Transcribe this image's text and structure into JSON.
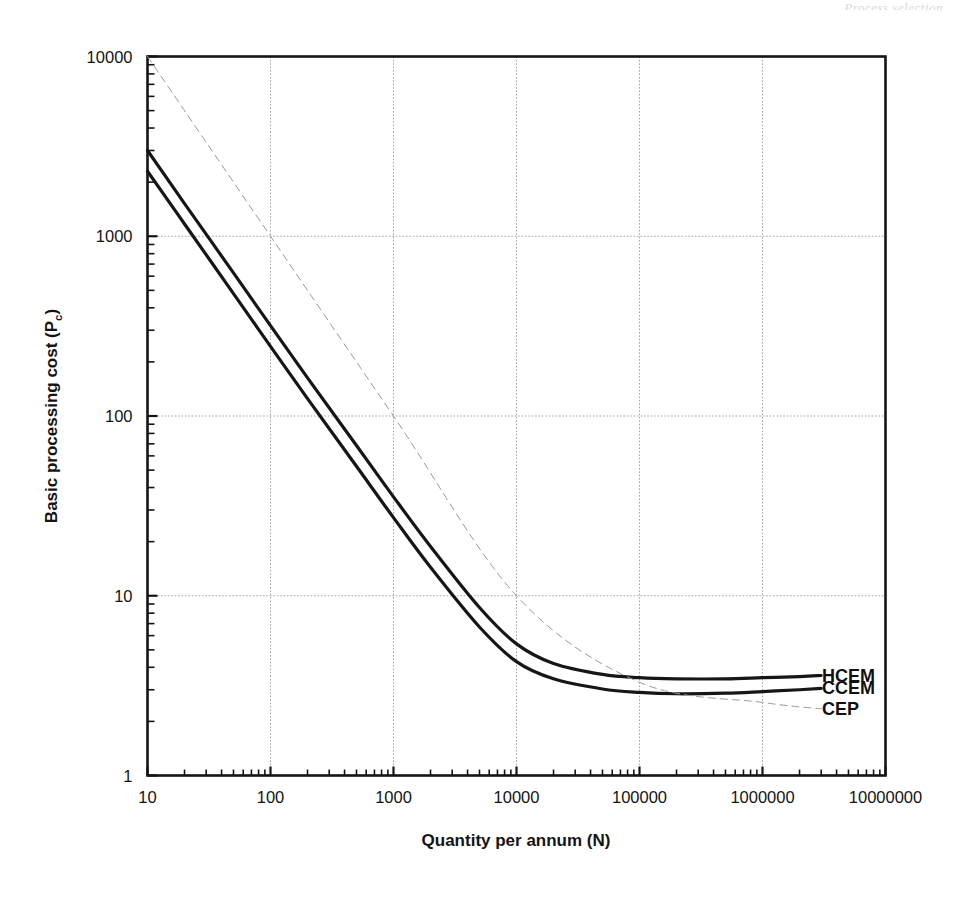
{
  "page": {
    "scan_header": "Process selection",
    "scan_footer": ""
  },
  "chart_data": {
    "type": "line",
    "title": "",
    "xlabel": "Quantity per annum (N)",
    "ylabel": "Basic processing cost (Pc)",
    "ylabel_base": "Basic processing cost (P",
    "ylabel_sub": "c",
    "ylabel_tail": ")",
    "xscale": "log",
    "yscale": "log",
    "xlim": [
      10,
      10000000
    ],
    "ylim": [
      1,
      10000
    ],
    "grid": true,
    "grid_style": "dotted-major",
    "legend_position": "right-inline-labels",
    "xticks": [
      "10",
      "100",
      "1000",
      "10000",
      "100000",
      "1000000",
      "10000000"
    ],
    "xtick_values": [
      10,
      100,
      1000,
      10000,
      100000,
      1000000,
      10000000
    ],
    "yticks": [
      "1",
      "10",
      "100",
      "1000",
      "10000"
    ],
    "ytick_values": [
      1,
      10,
      100,
      1000,
      10000
    ],
    "series": [
      {
        "name": "HCEM",
        "style": "solid-bold",
        "color": "#161616",
        "width": 3.2,
        "x": [
          10,
          20,
          50,
          100,
          200,
          500,
          1000,
          2000,
          5000,
          10000,
          20000,
          50000,
          100000,
          200000,
          500000,
          1000000,
          2000000,
          3000000
        ],
        "y": [
          3000,
          1520,
          625,
          318,
          163,
          68.5,
          35.5,
          18.8,
          8.6,
          5.4,
          4.2,
          3.65,
          3.5,
          3.45,
          3.45,
          3.5,
          3.55,
          3.6
        ]
      },
      {
        "name": "CCEM",
        "style": "solid-bold",
        "color": "#161616",
        "width": 3.2,
        "x": [
          10,
          20,
          50,
          100,
          200,
          500,
          1000,
          2000,
          5000,
          10000,
          20000,
          50000,
          100000,
          200000,
          500000,
          1000000,
          2000000,
          3000000
        ],
        "y": [
          2300,
          1170,
          480,
          244,
          125,
          52.5,
          27.2,
          14.4,
          6.7,
          4.3,
          3.45,
          3.03,
          2.9,
          2.85,
          2.87,
          2.93,
          3.0,
          3.05
        ]
      },
      {
        "name": "CEP",
        "style": "dashed-thin",
        "color": "#9a9a9a",
        "width": 1.0,
        "x": [
          10,
          100,
          1000,
          10000,
          100000,
          1000000,
          3000000
        ],
        "y": [
          10000,
          1000,
          100,
          10,
          3.3,
          2.55,
          2.35
        ]
      }
    ],
    "series_labels": [
      {
        "text": "HCEM",
        "anchor_y": 3.6
      },
      {
        "text": "CCEM",
        "anchor_y": 3.05
      },
      {
        "text": "CEP",
        "anchor_y": 2.35
      }
    ]
  }
}
